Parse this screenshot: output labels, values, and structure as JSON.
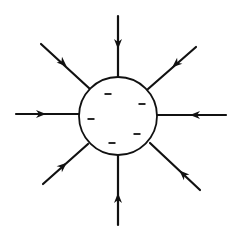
{
  "diagram": {
    "sphere": {
      "center": [
        118,
        116
      ],
      "radius": 39,
      "charge_sign": "negative",
      "charge_marks": [
        {
          "label": "-",
          "x": 108,
          "y": 94
        },
        {
          "label": "-",
          "x": 142,
          "y": 104
        },
        {
          "label": "-",
          "x": 91,
          "y": 119
        },
        {
          "label": "-",
          "x": 137,
          "y": 134
        },
        {
          "label": "-",
          "x": 112,
          "y": 143
        }
      ]
    },
    "field_lines": [
      {
        "name": "top",
        "from": [
          118,
          16
        ],
        "to": [
          118,
          77
        ],
        "arrow_at": [
          118,
          44
        ],
        "direction": "inward"
      },
      {
        "name": "top-right",
        "from": [
          196,
          47
        ],
        "to": [
          148,
          89
        ],
        "arrow_at": [
          176,
          64
        ],
        "direction": "inward"
      },
      {
        "name": "right",
        "from": [
          226,
          115
        ],
        "to": [
          157,
          115
        ],
        "arrow_at": [
          195,
          115
        ],
        "direction": "inward"
      },
      {
        "name": "bottom-right",
        "from": [
          200,
          190
        ],
        "to": [
          150,
          143
        ],
        "arrow_at": [
          183,
          174
        ],
        "direction": "inward"
      },
      {
        "name": "bottom",
        "from": [
          118,
          225
        ],
        "to": [
          118,
          155
        ],
        "arrow_at": [
          118,
          198
        ],
        "direction": "inward"
      },
      {
        "name": "bottom-left",
        "from": [
          43,
          184
        ],
        "to": [
          88,
          144
        ],
        "arrow_at": [
          63,
          166
        ],
        "direction": "inward"
      },
      {
        "name": "left",
        "from": [
          16,
          114
        ],
        "to": [
          79,
          114
        ],
        "arrow_at": [
          41,
          114
        ],
        "direction": "inward"
      },
      {
        "name": "top-left",
        "from": [
          41,
          44
        ],
        "to": [
          90,
          89
        ],
        "arrow_at": [
          63,
          63
        ],
        "direction": "inward"
      }
    ],
    "colors": {
      "stroke": "#111111",
      "background": "#ffffff"
    }
  }
}
